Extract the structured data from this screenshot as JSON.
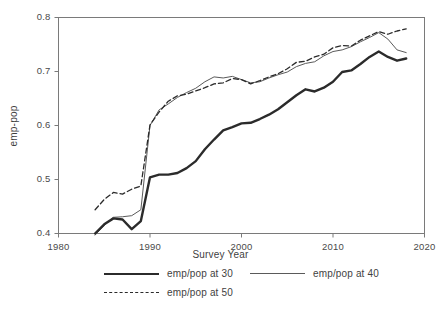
{
  "chart_data": {
    "type": "line",
    "title": "",
    "xlabel": "Survey Year",
    "ylabel": "emp-pop",
    "xlim": [
      1980,
      2020
    ],
    "ylim": [
      0.4,
      0.8
    ],
    "xticks": [
      1980,
      1990,
      2000,
      2010,
      2020
    ],
    "xtick_labels": [
      "1980",
      "1990",
      "2000",
      "2010",
      "2020"
    ],
    "yticks": [
      0.4,
      0.5,
      0.6,
      0.7,
      0.8
    ],
    "ytick_labels": [
      "0.4",
      "0.5",
      "0.6",
      "0.7",
      "0.8"
    ],
    "grid": false,
    "legend_position": "below",
    "x": [
      1984,
      1985,
      1986,
      1987,
      1988,
      1989,
      1990,
      1991,
      1992,
      1993,
      1994,
      1995,
      1996,
      1997,
      1998,
      1999,
      2000,
      2001,
      2002,
      2003,
      2004,
      2005,
      2006,
      2007,
      2008,
      2009,
      2010,
      2011,
      2012,
      2013,
      2014,
      2015,
      2016,
      2017,
      2018
    ],
    "series": [
      {
        "name": "emp/pop at 30",
        "style": "solid-thick",
        "color": "#2b2b2b",
        "values": [
          0.4,
          0.417,
          0.428,
          0.426,
          0.408,
          0.423,
          0.504,
          0.509,
          0.509,
          0.512,
          0.521,
          0.534,
          0.556,
          0.574,
          0.591,
          0.597,
          0.604,
          0.605,
          0.612,
          0.62,
          0.63,
          0.643,
          0.656,
          0.667,
          0.663,
          0.67,
          0.681,
          0.699,
          0.702,
          0.714,
          0.727,
          0.737,
          0.727,
          0.72,
          0.724
        ]
      },
      {
        "name": "emp/pop at 40",
        "style": "solid-thin",
        "color": "#5a5a5a",
        "values": [
          0.397,
          0.415,
          0.43,
          0.431,
          0.433,
          0.444,
          0.6,
          0.629,
          0.64,
          0.652,
          0.661,
          0.669,
          0.681,
          0.69,
          0.688,
          0.691,
          0.685,
          0.679,
          0.681,
          0.688,
          0.694,
          0.699,
          0.709,
          0.715,
          0.718,
          0.729,
          0.737,
          0.74,
          0.746,
          0.755,
          0.763,
          0.772,
          0.76,
          0.74,
          0.735
        ]
      },
      {
        "name": "emp/pop at 50",
        "style": "dashed",
        "color": "#2b2b2b",
        "values": [
          0.444,
          0.463,
          0.476,
          0.473,
          0.482,
          0.488,
          0.601,
          0.625,
          0.645,
          0.655,
          0.658,
          0.664,
          0.67,
          0.677,
          0.679,
          0.687,
          0.685,
          0.677,
          0.683,
          0.69,
          0.696,
          0.705,
          0.717,
          0.719,
          0.727,
          0.732,
          0.744,
          0.748,
          0.747,
          0.758,
          0.766,
          0.774,
          0.769,
          0.775,
          0.779
        ]
      }
    ]
  },
  "legend": {
    "items": [
      {
        "label": "emp/pop at 30"
      },
      {
        "label": "emp/pop at 40"
      },
      {
        "label": "emp/pop at 50"
      }
    ]
  }
}
